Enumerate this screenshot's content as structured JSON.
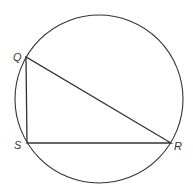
{
  "diagram": {
    "type": "geometry",
    "colors": {
      "stroke": "#333333",
      "background": "#ffffff"
    },
    "circle": {
      "cx": 99,
      "cy": 99,
      "r": 84
    },
    "vertices": [
      {
        "name": "Q",
        "label": "Q",
        "x": 26,
        "y": 57,
        "lx": 13,
        "ly": 61
      },
      {
        "name": "S",
        "label": "S",
        "x": 27,
        "y": 143,
        "lx": 14,
        "ly": 149
      },
      {
        "name": "R",
        "label": "R",
        "x": 171,
        "y": 143,
        "lx": 174,
        "ly": 150
      }
    ],
    "segments": [
      {
        "name": "QS",
        "from": "Q",
        "to": "S"
      },
      {
        "name": "SR",
        "from": "S",
        "to": "R"
      },
      {
        "name": "QR",
        "from": "Q",
        "to": "R"
      }
    ]
  }
}
